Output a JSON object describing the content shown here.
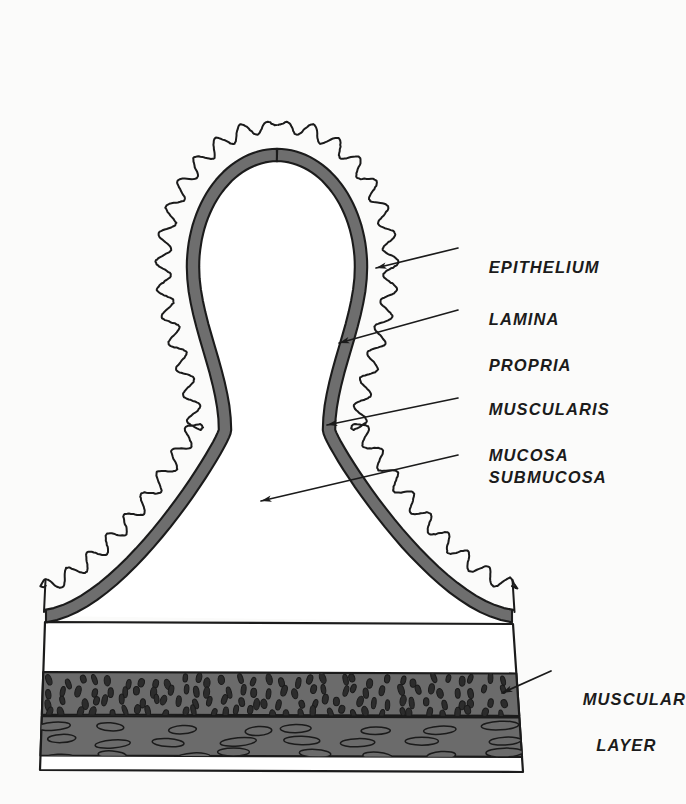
{
  "figure": {
    "kind": "anatomical-cross-section",
    "background_color": "#fbfbfa",
    "ink_color": "#1b1b1b",
    "shade_color": "#6e6e6e",
    "muscle_color": "#6b6b6b"
  },
  "labels": [
    {
      "id": "epithelium",
      "text": "EPITHELIUM",
      "text2": "",
      "x": 466,
      "y": 233
    },
    {
      "id": "lamina-propria",
      "text": "LAMINA",
      "text2": "PROPRIA",
      "x": 466,
      "y": 285
    },
    {
      "id": "muscularis-mucosa",
      "text": "MUSCULARIS",
      "text2": "MUCOSA",
      "x": 466,
      "y": 375
    },
    {
      "id": "submucosa",
      "text": "SUBMUCOSA",
      "text2": "",
      "x": 466,
      "y": 443
    },
    {
      "id": "muscular-layer",
      "text": "MUSCULAR",
      "text2": "LAYER",
      "x": 560,
      "y": 665
    }
  ],
  "leaders": [
    {
      "id": "leader-epithelium",
      "from_x": 458,
      "from_y": 248,
      "to_x": 376,
      "to_y": 268
    },
    {
      "id": "leader-lamina-propria",
      "from_x": 458,
      "from_y": 310,
      "to_x": 339,
      "to_y": 343
    },
    {
      "id": "leader-muscularis-mucosa",
      "from_x": 458,
      "from_y": 398,
      "to_x": 327,
      "to_y": 425
    },
    {
      "id": "leader-submucosa",
      "from_x": 458,
      "from_y": 455,
      "to_x": 261,
      "to_y": 501
    },
    {
      "id": "leader-muscular-layer",
      "from_x": 551,
      "from_y": 671,
      "to_x": 502,
      "to_y": 693
    }
  ],
  "structures": [
    {
      "id": "epithelium-wave",
      "name": "epithelium",
      "render": "scalloped-outline"
    },
    {
      "id": "lamina-propria-gap",
      "name": "lamina propria",
      "render": "white-band"
    },
    {
      "id": "muscularis-mucosa",
      "name": "muscularis mucosa",
      "render": "gray-arch-band"
    },
    {
      "id": "submucosa-core",
      "name": "submucosa",
      "render": "white-core"
    },
    {
      "id": "circular-muscle",
      "name": "circular muscle",
      "render": "gray-block-dots-vertical"
    },
    {
      "id": "longitudinal-muscle",
      "name": "longitudinal muscle",
      "render": "gray-block-dots-horizontal"
    }
  ]
}
